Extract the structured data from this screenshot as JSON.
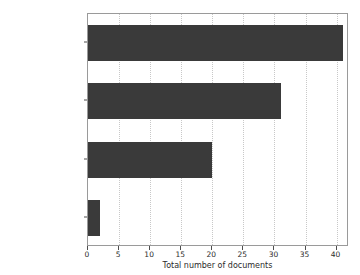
{
  "chart_data": {
    "type": "bar",
    "orientation": "horizontal",
    "title": "",
    "xlabel": "Total number of documents",
    "ylabel": "",
    "categories": [
      "Article",
      "Proceedings Paper",
      "Conference Paper",
      "Review"
    ],
    "values": [
      41,
      31,
      20,
      2
    ],
    "xticks": [
      0,
      5,
      10,
      15,
      20,
      25,
      30,
      35,
      40
    ],
    "xticklabels": [
      "0",
      "5",
      "10",
      "15",
      "20",
      "25",
      "30",
      "35",
      "40"
    ],
    "xlim": [
      0,
      42
    ],
    "ylim": [
      -0.5,
      3.5
    ],
    "grid": "vertical-dotted",
    "legend": null,
    "bar_color": "#3a3a3a",
    "grid_color": "#c8c8c8",
    "axis_color": "#9a9a9a",
    "background_color": "#ffffff"
  }
}
